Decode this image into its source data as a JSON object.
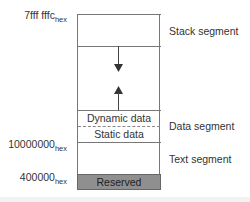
{
  "diagram": {
    "title": "",
    "addresses": [
      {
        "value": "7fff fffc",
        "suffix": "hex"
      },
      {
        "value": "10000000",
        "suffix": "hex"
      },
      {
        "value": "400000",
        "suffix": "hex"
      }
    ],
    "cells": {
      "dynamic": "Dynamic data",
      "static": "Static data",
      "reserved": "Reserved"
    },
    "segments": {
      "stack": "Stack segment",
      "data": "Data segment",
      "text": "Text segment"
    },
    "arrows": [
      {
        "direction": "down",
        "meaning": "stack grows down"
      },
      {
        "direction": "up",
        "meaning": "dynamic data grows up"
      }
    ],
    "colors": {
      "reserved_fill": "#8f8f8f",
      "lines": "#777777"
    }
  }
}
